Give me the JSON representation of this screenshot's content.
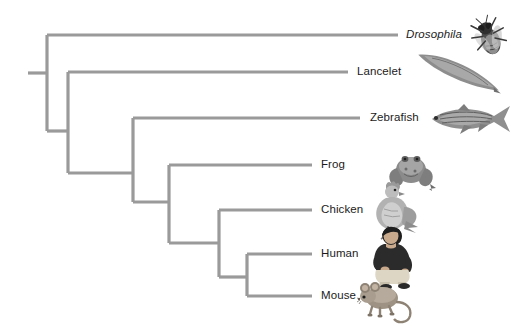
{
  "figure": {
    "type": "phylogenetic-tree",
    "orientation": "left-to-right-cladogram",
    "background_color": "#ffffff",
    "branch_color": "#9a9a9a",
    "branch_width_px": 3.2,
    "label_color": "#1b1b1b",
    "width_px": 520,
    "height_px": 331
  },
  "taxa": [
    {
      "id": "drosophila",
      "label": "Drosophila",
      "italic": true,
      "tip_y": 35,
      "branch_start_x": 47,
      "branch_end_x": 398,
      "label_x": 406,
      "icon_name": "fly-illustration",
      "icon_x": 462,
      "icon_y": 12,
      "icon_w": 52,
      "icon_h": 48
    },
    {
      "id": "lancelet",
      "label": "Lancelet",
      "italic": false,
      "tip_y": 72,
      "branch_start_x": 68,
      "branch_end_x": 348,
      "label_x": 357,
      "icon_name": "lancelet-illustration",
      "icon_x": 410,
      "icon_y": 54,
      "icon_w": 96,
      "icon_h": 40
    },
    {
      "id": "zebrafish",
      "label": "Zebrafish",
      "italic": false,
      "tip_y": 118,
      "branch_start_x": 133,
      "branch_end_x": 360,
      "label_x": 370,
      "icon_name": "zebrafish-illustration",
      "icon_x": 424,
      "icon_y": 100,
      "icon_w": 90,
      "icon_h": 38
    },
    {
      "id": "frog",
      "label": "Frog",
      "italic": false,
      "tip_y": 165,
      "branch_start_x": 169,
      "branch_end_x": 312,
      "label_x": 321,
      "icon_name": "frog-illustration",
      "icon_x": 384,
      "icon_y": 146,
      "icon_w": 54,
      "icon_h": 46
    },
    {
      "id": "chicken",
      "label": "Chicken",
      "italic": false,
      "tip_y": 210,
      "branch_start_x": 219,
      "branch_end_x": 312,
      "label_x": 321,
      "icon_name": "chicken-illustration",
      "icon_x": 366,
      "icon_y": 177,
      "icon_w": 56,
      "icon_h": 64
    },
    {
      "id": "human",
      "label": "Human",
      "italic": false,
      "tip_y": 254,
      "branch_start_x": 247,
      "branch_end_x": 312,
      "label_x": 321,
      "icon_name": "human-illustration",
      "icon_x": 364,
      "icon_y": 224,
      "icon_w": 56,
      "icon_h": 66
    },
    {
      "id": "mouse",
      "label": "Mouse",
      "italic": false,
      "tip_y": 296,
      "branch_start_x": 247,
      "branch_end_x": 312,
      "label_x": 321,
      "icon_name": "mouse-illustration",
      "icon_x": 356,
      "icon_y": 278,
      "icon_w": 62,
      "icon_h": 48
    }
  ],
  "nodes": [
    {
      "id": "root-stub",
      "description": "root branch stub entering node-1",
      "x1": 28,
      "y1": 73,
      "x2": 47,
      "y2": 73
    },
    {
      "id": "node-1",
      "description": "split: Drosophila vs all chordates",
      "x": 47,
      "y_top": 35,
      "y_bottom": 131,
      "child_horizontal_x2": 68
    },
    {
      "id": "node-2",
      "description": "split: Lancelet vs vertebrates",
      "x": 68,
      "y_top": 72,
      "y_bottom": 173,
      "child_horizontal_x2": 133
    },
    {
      "id": "node-3",
      "description": "split: Zebrafish vs tetrapods",
      "x": 133,
      "y_top": 118,
      "y_bottom": 202,
      "child_horizontal_x2": 169
    },
    {
      "id": "node-4",
      "description": "split: Frog vs amniotes",
      "x": 169,
      "y_top": 165,
      "y_bottom": 243,
      "child_horizontal_x2": 219
    },
    {
      "id": "node-5",
      "description": "split: Chicken vs mammals",
      "x": 219,
      "y_top": 210,
      "y_bottom": 277,
      "child_horizontal_x2": 247
    },
    {
      "id": "node-6",
      "description": "split: Human vs Mouse",
      "x": 247,
      "y_top": 254,
      "y_bottom": 296,
      "child_horizontal_x2": 247
    }
  ],
  "internal_connectors": [
    {
      "id": "conn-1",
      "from_node": "node-1",
      "to_node": "node-2",
      "x1": 47,
      "y": 131,
      "x2": 68
    },
    {
      "id": "conn-2",
      "from_node": "node-2",
      "to_node": "node-3",
      "x1": 68,
      "y": 173,
      "x2": 133
    },
    {
      "id": "conn-3",
      "from_node": "node-3",
      "to_node": "node-4",
      "x1": 133,
      "y": 202,
      "x2": 169
    },
    {
      "id": "conn-4",
      "from_node": "node-4",
      "to_node": "node-5",
      "x1": 169,
      "y": 243,
      "x2": 219
    },
    {
      "id": "conn-5",
      "from_node": "node-5",
      "to_node": "node-6",
      "x1": 219,
      "y": 277,
      "x2": 247
    }
  ]
}
